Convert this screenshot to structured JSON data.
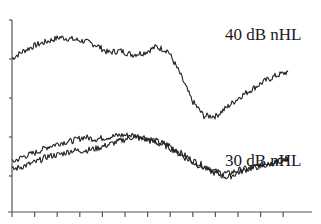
{
  "chart_data": {
    "type": "line",
    "title": "",
    "xlabel": "",
    "ylabel": "",
    "grid": false,
    "legend": "inline annotations",
    "annotations": [
      {
        "text": "40 dB nHL",
        "x": 225,
        "y": 40
      },
      {
        "text": "30 dB nHL",
        "x": 225,
        "y": 165
      }
    ],
    "x_ticks_count": 13,
    "y_ticks_count": 5,
    "xlim": [
      0,
      12
    ],
    "ylim": [
      0,
      5
    ],
    "series": [
      {
        "name": "40 dB nHL",
        "x": [
          0,
          0.5,
          1,
          1.5,
          2,
          2.5,
          3,
          3.5,
          4,
          4.5,
          5,
          5.5,
          6,
          6.5,
          7,
          7.5,
          8,
          8.5,
          9,
          9.5,
          10,
          10.5,
          11,
          11.5
        ],
        "values": [
          4.0,
          4.2,
          4.35,
          4.45,
          4.55,
          4.5,
          4.45,
          4.35,
          4.15,
          4.2,
          4.1,
          4.15,
          4.3,
          4.2,
          3.6,
          2.9,
          2.5,
          2.5,
          2.75,
          3.0,
          3.2,
          3.4,
          3.55,
          3.65
        ]
      },
      {
        "name": "30 dB nHL (trace 1)",
        "x": [
          0,
          0.5,
          1,
          1.5,
          2,
          2.5,
          3,
          3.5,
          4,
          4.5,
          5,
          5.5,
          6,
          6.5,
          7,
          7.5,
          8,
          8.5,
          9,
          9.5,
          10,
          10.5,
          11,
          11.5
        ],
        "values": [
          1.3,
          1.45,
          1.55,
          1.7,
          1.8,
          1.85,
          1.95,
          1.9,
          1.95,
          2.0,
          2.0,
          1.95,
          1.85,
          1.75,
          1.55,
          1.35,
          1.2,
          1.05,
          1.0,
          1.1,
          1.15,
          1.25,
          1.3,
          1.4
        ]
      },
      {
        "name": "30 dB nHL (trace 2)",
        "x": [
          0,
          0.5,
          1,
          1.5,
          2,
          2.5,
          3,
          3.5,
          4,
          4.5,
          5,
          5.5,
          6,
          6.5,
          7,
          7.5,
          8,
          8.5,
          9,
          9.5,
          10,
          10.5,
          11,
          11.5
        ],
        "values": [
          1.1,
          1.2,
          1.3,
          1.45,
          1.5,
          1.6,
          1.6,
          1.65,
          1.75,
          1.85,
          1.95,
          1.9,
          1.8,
          1.7,
          1.5,
          1.3,
          1.15,
          1.0,
          0.9,
          1.05,
          1.15,
          1.2,
          1.3,
          1.4
        ]
      }
    ]
  }
}
